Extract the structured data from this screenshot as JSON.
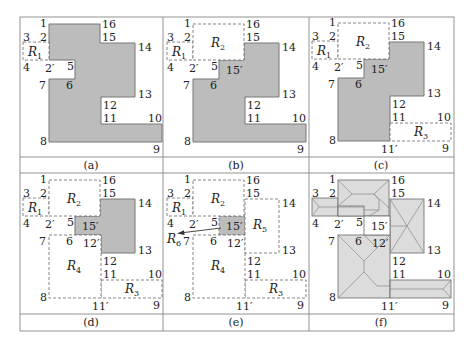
{
  "colors": {
    "fill_dark": "#bcbcbc",
    "fill_light": "#dcdcdc",
    "line": "#777777",
    "text": "#222222"
  },
  "captions": [
    "(a)",
    "(b)",
    "(c)",
    "(d)",
    "(e)",
    "(f)"
  ],
  "vertex_labels": {
    "v1": "1",
    "v2": "2",
    "v3": "3",
    "v4": "4",
    "v2p": "2′",
    "v5": "5",
    "v6": "6",
    "v7": "7",
    "v8": "8",
    "v9": "9",
    "v10": "10",
    "v11": "11",
    "v11p": "11′",
    "v12": "12",
    "v12p": "12′",
    "v13": "13",
    "v14": "14",
    "v15": "15",
    "v15p": "15′",
    "v16": "16"
  },
  "regions": {
    "r1": "R",
    "r2": "R",
    "r3": "R",
    "r4": "R",
    "r5": "R",
    "r6": "R",
    "s1": "1",
    "s2": "2",
    "s3": "3",
    "s4": "4",
    "s5": "5",
    "s6": "6"
  }
}
